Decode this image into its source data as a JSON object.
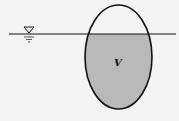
{
  "figure": {
    "labels": {
      "volume": "V"
    },
    "water_surface": {
      "y": 34,
      "x_start": 9,
      "x_end": 176,
      "symbol": "free-surface-triangle"
    },
    "body": {
      "shape": "ellipse",
      "cx": 118.5,
      "cy": 57,
      "rx": 33.5,
      "ry": 52
    },
    "colors": {
      "background": "#f4f4f4",
      "submerged_fill": "#b9b9b9",
      "stroke": "#111111"
    }
  }
}
